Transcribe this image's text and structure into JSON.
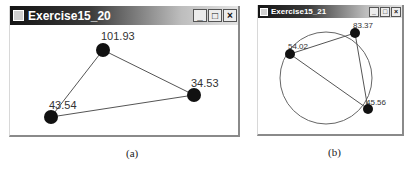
{
  "window_a": {
    "title": "Exercise15_20",
    "buttons": {
      "minimize": "_",
      "maximize": "□",
      "close": "×"
    },
    "points": [
      {
        "x": 93,
        "y": 25,
        "label": "101.93"
      },
      {
        "x": 184,
        "y": 70,
        "label": "34.53"
      },
      {
        "x": 41,
        "y": 92,
        "label": "43.54"
      }
    ],
    "caption": "(a)"
  },
  "window_b": {
    "title": "Exercise15_21",
    "buttons": {
      "minimize": "_",
      "maximize": "□",
      "close": "×"
    },
    "circle": {
      "cx": 68,
      "cy": 60,
      "r": 46
    },
    "points": [
      {
        "x": 97,
        "y": 15,
        "label": "83.37"
      },
      {
        "x": 32,
        "y": 36,
        "label": "54.02"
      },
      {
        "x": 110,
        "y": 91,
        "label": "45.56"
      }
    ],
    "caption": "(b)"
  },
  "colors": {
    "point": "#111111",
    "line": "#555555",
    "text": "#333333"
  }
}
